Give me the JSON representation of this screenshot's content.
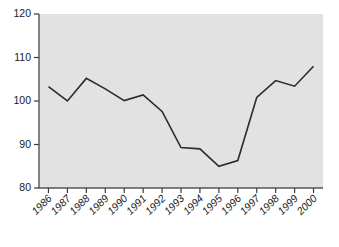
{
  "chart_data": {
    "type": "line",
    "title": "",
    "subtitle": "",
    "xlabel": "",
    "ylabel": "",
    "categories": [
      "1986",
      "1987",
      "1988",
      "1989",
      "1990",
      "1991",
      "1992",
      "1993",
      "1994",
      "1995",
      "1996",
      "1997",
      "1998",
      "1999",
      "2000"
    ],
    "values": [
      103.3,
      100.0,
      105.2,
      102.8,
      100.1,
      101.4,
      97.6,
      89.3,
      89.0,
      85.0,
      86.3,
      100.8,
      104.7,
      103.4,
      108.0
    ],
    "series": [
      {
        "name": "",
        "values": [
          103.3,
          100.0,
          105.2,
          102.8,
          100.1,
          101.4,
          97.6,
          89.3,
          89.0,
          85.0,
          86.3,
          100.8,
          104.7,
          103.4,
          108.0
        ]
      }
    ],
    "ylim": [
      80,
      120
    ],
    "yticks": [
      80,
      90,
      100,
      110,
      120
    ],
    "ytick_labels": [
      "80",
      "90",
      "100",
      "110",
      "120"
    ],
    "xtick_labels": [
      "1986",
      "1987",
      "1988",
      "1989",
      "1990",
      "1991",
      "1992",
      "1993",
      "1994",
      "1995",
      "1996",
      "1997",
      "1998",
      "1999",
      "2000"
    ],
    "grid": false,
    "legend": false,
    "legend_position": "none",
    "annotations": [],
    "colors": {
      "plot_background": "#e2e2e2",
      "page_background": "#ffffff",
      "line": "#2b2b2b",
      "axis": "#555555",
      "tick": "#3a3a3a",
      "label_text": "#1a1a1a"
    },
    "xtick_label_rotation": 45
  }
}
